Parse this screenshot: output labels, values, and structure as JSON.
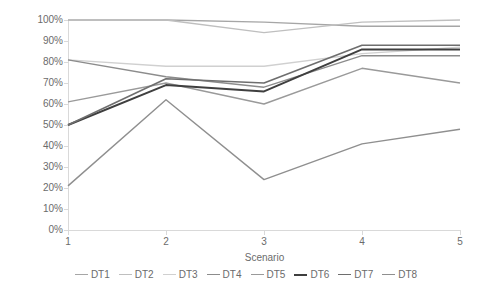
{
  "chart_data": {
    "type": "line",
    "title": "",
    "xlabel": "Scenario",
    "ylabel": "",
    "x": [
      1,
      2,
      3,
      4,
      5
    ],
    "categories": [
      "1",
      "2",
      "3",
      "4",
      "5"
    ],
    "xtick_labels": [
      "1",
      "2",
      "3",
      "4",
      "5"
    ],
    "ytick_labels": [
      "0%",
      "10%",
      "20%",
      "30%",
      "40%",
      "50%",
      "60%",
      "70%",
      "80%",
      "90%",
      "100%"
    ],
    "ytick_values": [
      0,
      10,
      20,
      30,
      40,
      50,
      60,
      70,
      80,
      90,
      100
    ],
    "ylim": [
      0,
      100
    ],
    "xlim": [
      1,
      5
    ],
    "y_axis_unit": "%",
    "grid": false,
    "legend_position": "bottom",
    "series": [
      {
        "name": "DT1",
        "color": "#a6a6a6",
        "width": 1.4,
        "values": [
          100,
          100,
          99,
          97,
          97
        ]
      },
      {
        "name": "DT2",
        "color": "#bfbfbf",
        "width": 1.4,
        "values": [
          100,
          100,
          94,
          99,
          100
        ]
      },
      {
        "name": "DT3",
        "color": "#d0d0d0",
        "width": 1.4,
        "values": [
          81,
          78,
          78,
          84,
          87
        ]
      },
      {
        "name": "DT4",
        "color": "#8c8c8c",
        "width": 1.4,
        "values": [
          81,
          73,
          68,
          83,
          83
        ]
      },
      {
        "name": "DT5",
        "color": "#9a9a9a",
        "width": 1.4,
        "values": [
          61,
          70,
          60,
          77,
          70
        ]
      },
      {
        "name": "DT6",
        "color": "#3f3f3f",
        "width": 2.0,
        "values": [
          50,
          69,
          66,
          86,
          86
        ]
      },
      {
        "name": "DT7",
        "color": "#6e6e6e",
        "width": 1.6,
        "values": [
          50,
          72,
          70,
          88,
          88
        ]
      },
      {
        "name": "DT8",
        "color": "#8f8f8f",
        "width": 1.4,
        "values": [
          21,
          62,
          24,
          41,
          48
        ]
      }
    ]
  },
  "axis": {
    "x_title": "Scenario"
  }
}
